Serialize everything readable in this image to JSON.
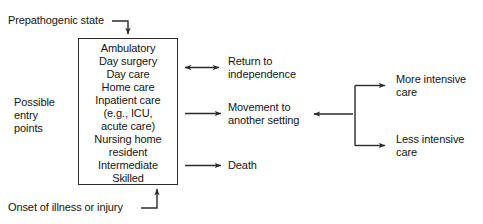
{
  "diagram": {
    "stroke_color": "#2b2b2b",
    "text_color": "#141414",
    "background_color": "#ffffff"
  },
  "inputs": {
    "top_label": "Prepathogenic state",
    "bottom_label": "Onset of illness or injury",
    "side_label": "Possible\nentry\npoints"
  },
  "entry_box": {
    "name": "care settings box",
    "lines": [
      "Ambulatory",
      "Day surgery",
      "Day care",
      "Home care",
      "Inpatient care",
      "(e.g., ICU,",
      "acute care)",
      "Nursing home",
      "resident",
      "Intermediate",
      "Skilled"
    ]
  },
  "outcomes": [
    {
      "label": "Return to\nindependence",
      "arrow": "double"
    },
    {
      "label": "Movement to\nanother setting",
      "arrow": "right"
    },
    {
      "label": "Death",
      "arrow": "right"
    }
  ],
  "intensity_branch": {
    "more": "More intensive\ncare",
    "less": "Less intensive\ncare"
  }
}
